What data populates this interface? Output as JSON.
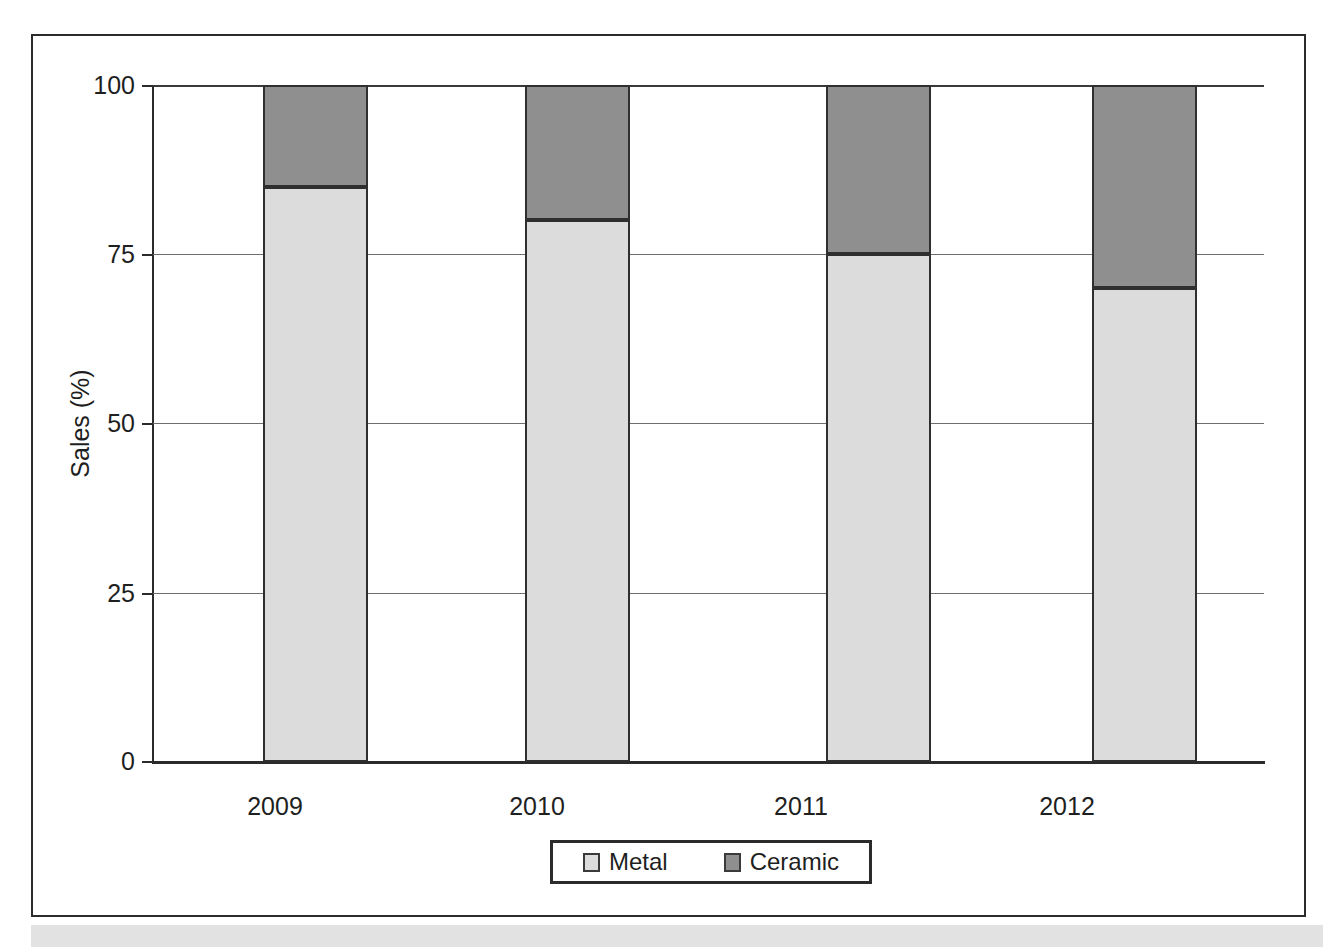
{
  "chart_data": {
    "type": "bar",
    "subtype": "stacked-percentage",
    "title": "",
    "xlabel": "",
    "ylabel": "Sales (%)",
    "ylim": [
      0,
      100
    ],
    "yticks": [
      0,
      25,
      50,
      75,
      100
    ],
    "ytick_labels": [
      "0",
      "25",
      "50",
      "75",
      "100"
    ],
    "grid": true,
    "grid_axis": "y",
    "legend_position": "bottom-center",
    "categories": [
      "2009",
      "2010",
      "2011",
      "2012"
    ],
    "series": [
      {
        "name": "Metal",
        "color": "#dcdcdc",
        "values": [
          85,
          80,
          75,
          70
        ]
      },
      {
        "name": "Ceramic",
        "color": "#8f8f8f",
        "values": [
          15,
          20,
          25,
          30
        ]
      }
    ]
  },
  "legend": {
    "items": [
      {
        "label": "Metal",
        "swatch": "light-gray-square-icon"
      },
      {
        "label": "Ceramic",
        "swatch": "dark-gray-square-icon"
      }
    ]
  }
}
